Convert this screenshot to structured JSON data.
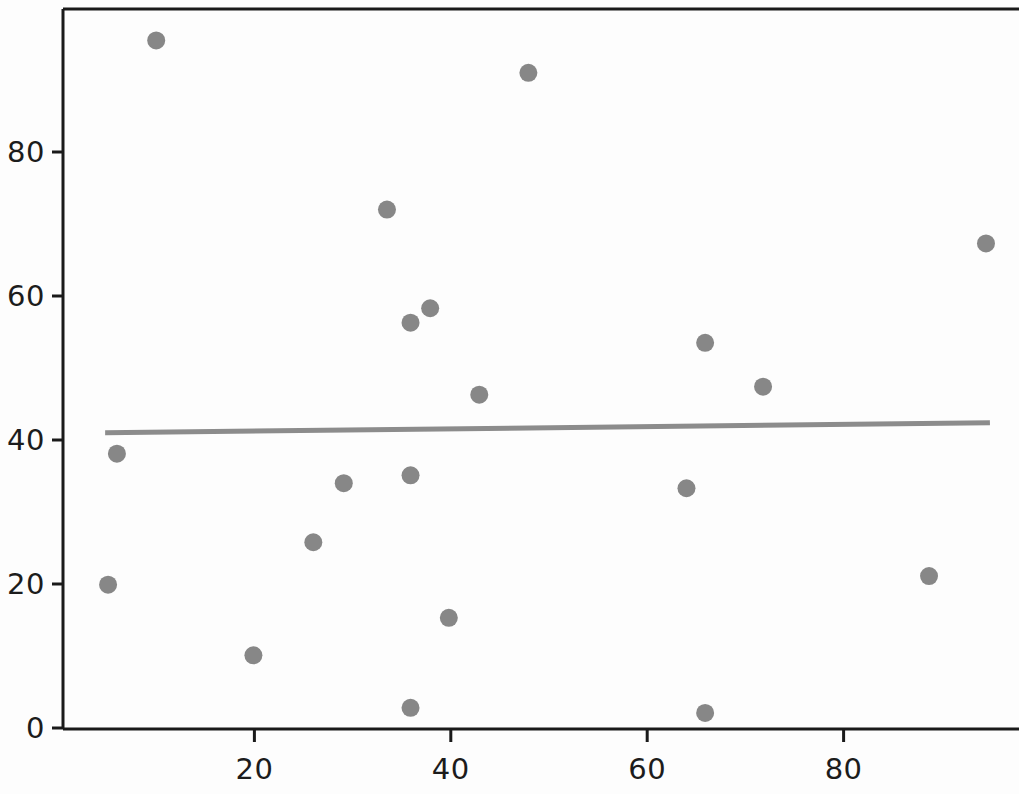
{
  "chart_data": {
    "type": "scatter",
    "title": "",
    "subtitle": "",
    "xlabel": "",
    "ylabel": "",
    "xlim": [
      0.4,
      98.0
    ],
    "ylim": [
      -1.5,
      99.5
    ],
    "grid": false,
    "legend": null,
    "xticks": [
      20,
      40,
      60,
      80
    ],
    "xtick_labels": [
      "20",
      "40",
      "60",
      "80"
    ],
    "yticks": [
      0,
      20,
      40,
      60,
      80
    ],
    "ytick_labels": [
      "0",
      "20",
      "40",
      "60",
      "80"
    ],
    "marker": {
      "shape": "circle",
      "color": "#878787",
      "size_px": 18
    },
    "series": [
      {
        "name": "points",
        "type": "scatter",
        "points": [
          {
            "x": 10.0,
            "y": 95.5
          },
          {
            "x": 47.9,
            "y": 91.0
          },
          {
            "x": 33.5,
            "y": 72.0
          },
          {
            "x": 94.5,
            "y": 67.3
          },
          {
            "x": 37.9,
            "y": 58.3
          },
          {
            "x": 35.9,
            "y": 56.3
          },
          {
            "x": 65.9,
            "y": 53.5
          },
          {
            "x": 71.8,
            "y": 47.4
          },
          {
            "x": 42.9,
            "y": 46.3
          },
          {
            "x": 6.0,
            "y": 38.1
          },
          {
            "x": 35.9,
            "y": 35.1
          },
          {
            "x": 29.1,
            "y": 34.0
          },
          {
            "x": 64.0,
            "y": 33.3
          },
          {
            "x": 26.0,
            "y": 25.8
          },
          {
            "x": 88.7,
            "y": 21.1
          },
          {
            "x": 5.1,
            "y": 19.9
          },
          {
            "x": 39.8,
            "y": 15.3
          },
          {
            "x": 19.9,
            "y": 10.1
          },
          {
            "x": 35.9,
            "y": 2.8
          },
          {
            "x": 65.9,
            "y": 2.1
          }
        ]
      }
    ],
    "trendline": {
      "name": "regression-line",
      "type": "line",
      "color": "#8c8c8c",
      "width_px": 5,
      "x_start": 4.8,
      "y_start": 41.0,
      "x_end": 94.9,
      "y_end": 42.4
    }
  },
  "axes": {
    "frame_color": "#1a1a1a",
    "tick_color": "#1a1a1a"
  }
}
